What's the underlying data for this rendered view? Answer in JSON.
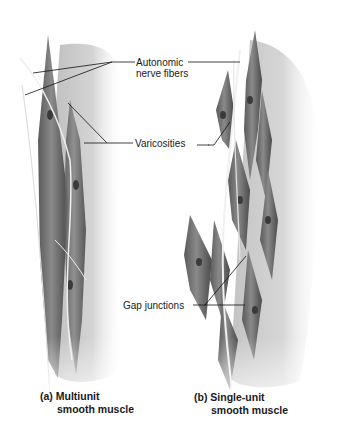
{
  "figure": {
    "labels": {
      "autonomic_line1": "Autonomic",
      "autonomic_line2": "nerve fibers",
      "varicosities": "Varicosities",
      "gap_junctions": "Gap junctions"
    },
    "panels": [
      {
        "caption_line1": "(a) Multiunit",
        "caption_line2": "smooth muscle"
      },
      {
        "caption_line1": "(b) Single-unit",
        "caption_line2": "smooth muscle"
      }
    ]
  }
}
